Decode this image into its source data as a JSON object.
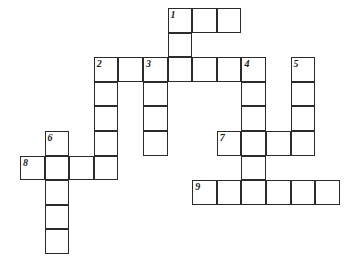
{
  "puzzle": {
    "title": "Crossword Puzzle Grid",
    "type": "blank-crossword",
    "cell_size": 24.6,
    "grid_color": "#2b2b2b",
    "cell_fill": "#ffffff",
    "background": "#ffffff",
    "origin_x": 20,
    "origin_y": 8,
    "columns": 13,
    "rows": 10,
    "entry_count": 9,
    "entries": [
      {
        "number": "1",
        "direction": "across",
        "col": 6,
        "row": 0,
        "length": 3,
        "label": "1"
      },
      {
        "number": "1",
        "direction": "down",
        "col": 6,
        "row": 0,
        "length": 3,
        "label": "1"
      },
      {
        "number": "2",
        "direction": "across",
        "col": 3,
        "row": 2,
        "length": 7,
        "label": "2"
      },
      {
        "number": "2",
        "direction": "down",
        "col": 3,
        "row": 2,
        "length": 5,
        "label": "2"
      },
      {
        "number": "3",
        "direction": "down",
        "col": 5,
        "row": 2,
        "length": 4,
        "label": "3"
      },
      {
        "number": "4",
        "direction": "down",
        "col": 9,
        "row": 2,
        "length": 6,
        "label": "4"
      },
      {
        "number": "5",
        "direction": "down",
        "col": 11,
        "row": 2,
        "length": 4,
        "label": "5"
      },
      {
        "number": "6",
        "direction": "down",
        "col": 1,
        "row": 5,
        "length": 5,
        "label": "6"
      },
      {
        "number": "7",
        "direction": "across",
        "col": 8,
        "row": 5,
        "length": 4,
        "label": "7"
      },
      {
        "number": "8",
        "direction": "across",
        "col": 0,
        "row": 6,
        "length": 4,
        "label": "8"
      },
      {
        "number": "9",
        "direction": "across",
        "col": 7,
        "row": 7,
        "length": 6,
        "label": "9"
      }
    ],
    "cells": [
      {
        "col": 6,
        "row": 0,
        "name": "cell-r0c6"
      },
      {
        "col": 7,
        "row": 0,
        "name": "cell-r0c7"
      },
      {
        "col": 8,
        "row": 0,
        "name": "cell-r0c8"
      },
      {
        "col": 6,
        "row": 1,
        "name": "cell-r1c6"
      },
      {
        "col": 3,
        "row": 2,
        "name": "cell-r2c3"
      },
      {
        "col": 4,
        "row": 2,
        "name": "cell-r2c4"
      },
      {
        "col": 5,
        "row": 2,
        "name": "cell-r2c5"
      },
      {
        "col": 6,
        "row": 2,
        "name": "cell-r2c6"
      },
      {
        "col": 7,
        "row": 2,
        "name": "cell-r2c7"
      },
      {
        "col": 8,
        "row": 2,
        "name": "cell-r2c8"
      },
      {
        "col": 9,
        "row": 2,
        "name": "cell-r2c9"
      },
      {
        "col": 11,
        "row": 2,
        "name": "cell-r2c11"
      },
      {
        "col": 3,
        "row": 3,
        "name": "cell-r3c3"
      },
      {
        "col": 5,
        "row": 3,
        "name": "cell-r3c5"
      },
      {
        "col": 9,
        "row": 3,
        "name": "cell-r3c9"
      },
      {
        "col": 11,
        "row": 3,
        "name": "cell-r3c11"
      },
      {
        "col": 3,
        "row": 4,
        "name": "cell-r4c3"
      },
      {
        "col": 5,
        "row": 4,
        "name": "cell-r4c5"
      },
      {
        "col": 9,
        "row": 4,
        "name": "cell-r4c9"
      },
      {
        "col": 11,
        "row": 4,
        "name": "cell-r4c11"
      },
      {
        "col": 1,
        "row": 5,
        "name": "cell-r5c1"
      },
      {
        "col": 3,
        "row": 5,
        "name": "cell-r5c3"
      },
      {
        "col": 5,
        "row": 5,
        "name": "cell-r5c5"
      },
      {
        "col": 8,
        "row": 5,
        "name": "cell-r5c8"
      },
      {
        "col": 9,
        "row": 5,
        "name": "cell-r5c9"
      },
      {
        "col": 10,
        "row": 5,
        "name": "cell-r5c10"
      },
      {
        "col": 11,
        "row": 5,
        "name": "cell-r5c11"
      },
      {
        "col": 0,
        "row": 6,
        "name": "cell-r6c0"
      },
      {
        "col": 1,
        "row": 6,
        "name": "cell-r6c1"
      },
      {
        "col": 2,
        "row": 6,
        "name": "cell-r6c2"
      },
      {
        "col": 3,
        "row": 6,
        "name": "cell-r6c3"
      },
      {
        "col": 9,
        "row": 6,
        "name": "cell-r6c9"
      },
      {
        "col": 1,
        "row": 7,
        "name": "cell-r7c1"
      },
      {
        "col": 7,
        "row": 7,
        "name": "cell-r7c7"
      },
      {
        "col": 8,
        "row": 7,
        "name": "cell-r7c8"
      },
      {
        "col": 9,
        "row": 7,
        "name": "cell-r7c9"
      },
      {
        "col": 10,
        "row": 7,
        "name": "cell-r7c10"
      },
      {
        "col": 11,
        "row": 7,
        "name": "cell-r7c11"
      },
      {
        "col": 12,
        "row": 7,
        "name": "cell-r7c12"
      },
      {
        "col": 1,
        "row": 8,
        "name": "cell-r8c1"
      },
      {
        "col": 1,
        "row": 9,
        "name": "cell-r9c1"
      }
    ]
  }
}
